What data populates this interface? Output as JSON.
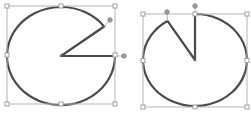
{
  "canvas": {
    "width": 251,
    "height": 114,
    "background": "#ffffff"
  },
  "colors": {
    "outline": "#4a4a4a",
    "frame": "#b4b4b4",
    "handle_stroke": "#a0a0a0",
    "adjust_handle": "#9a9a9a"
  },
  "shapes": [
    {
      "name": "pie-shape-left",
      "type": "pie",
      "center": [
        61,
        56
      ],
      "rx": 54,
      "ry": 49,
      "opening_from_deg": -37,
      "opening_to_deg": 0,
      "bounds": {
        "x": 7,
        "y": 6,
        "w": 108,
        "h": 98
      },
      "adjust_handles": [
        [
          110,
          20
        ],
        [
          124,
          56
        ]
      ]
    },
    {
      "name": "pie-shape-right",
      "type": "pie",
      "center": [
        195,
        60
      ],
      "rx": 52,
      "ry": 46,
      "opening_from_deg": -122,
      "opening_to_deg": -90,
      "bounds": {
        "x": 143,
        "y": 14,
        "w": 104,
        "h": 93
      },
      "adjust_handles": [
        [
          167,
          12
        ],
        [
          195,
          6
        ]
      ]
    }
  ]
}
